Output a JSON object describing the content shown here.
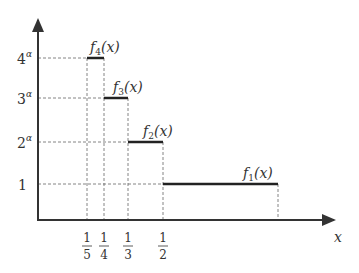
{
  "diagram": {
    "type": "step-function-plot",
    "x_axis_label": "x",
    "y_ticks": [
      {
        "base": "4",
        "exp": "α",
        "value": "4^α"
      },
      {
        "base": "3",
        "exp": "α",
        "value": "3^α"
      },
      {
        "base": "2",
        "exp": "α",
        "value": "2^α"
      },
      {
        "base": "1",
        "exp": "",
        "value": "1"
      }
    ],
    "x_ticks": [
      {
        "num": "1",
        "den": "5",
        "value": "1/5"
      },
      {
        "num": "1",
        "den": "4",
        "value": "1/4"
      },
      {
        "num": "1",
        "den": "3",
        "value": "1/3"
      },
      {
        "num": "1",
        "den": "2",
        "value": "1/2"
      }
    ],
    "functions": [
      {
        "name": "f",
        "sub": "4",
        "arg": "(x)",
        "label": "f4(x)",
        "level": "4^α",
        "interval": [
          "1/5",
          "1/4"
        ]
      },
      {
        "name": "f",
        "sub": "3",
        "arg": "(x)",
        "label": "f3(x)",
        "level": "3^α",
        "interval": [
          "1/4",
          "1/3"
        ]
      },
      {
        "name": "f",
        "sub": "2",
        "arg": "(x)",
        "label": "f2(x)",
        "level": "2^α",
        "interval": [
          "1/3",
          "1/2"
        ]
      },
      {
        "name": "f",
        "sub": "1",
        "arg": "(x)",
        "label": "f1(x)",
        "level": "1",
        "interval": [
          "1/2",
          "1"
        ]
      }
    ],
    "colors": {
      "axis": "#333333",
      "step": "#222222",
      "dashed": "#666666",
      "text": "#333333"
    }
  }
}
